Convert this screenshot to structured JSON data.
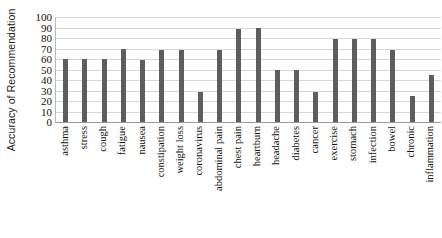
{
  "chart_data": {
    "type": "bar",
    "title": "",
    "xlabel": "",
    "ylabel": "Accuracy of Recommendation",
    "ylim": [
      0,
      100
    ],
    "yticks": [
      100,
      90,
      80,
      70,
      60,
      50,
      40,
      30,
      20,
      10,
      0
    ],
    "grid": true,
    "legend": null,
    "bar_color": "#5e5e5e",
    "categories": [
      "asthma",
      "stress",
      "cough",
      "fatigue",
      "nausea",
      "constipation",
      "weight loss",
      "coronavirus",
      "abdominal pain",
      "chest pain",
      "heartburn",
      "headache",
      "diabetes",
      "cancer",
      "exercise",
      "stomach",
      "infection",
      "bowel",
      "chronic",
      "inflammation"
    ],
    "values": [
      60,
      60,
      60,
      70,
      59,
      69,
      69,
      29,
      69,
      89,
      90,
      50,
      50,
      29,
      79,
      79,
      79,
      69,
      25,
      45
    ]
  }
}
